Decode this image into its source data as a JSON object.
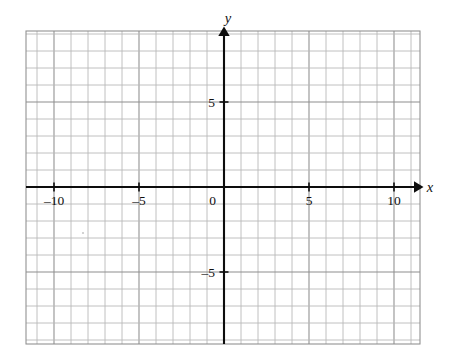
{
  "figure": {
    "kind": "cartesian-coordinate-plane",
    "title": "",
    "background_color": "#ffffff",
    "grid_color": "#b9b9b9",
    "axis_color": "#0d0d0d",
    "label_color": "#111111"
  },
  "chart_data": {
    "type": "scatter",
    "title": "",
    "xlabel": "x",
    "ylabel": "y",
    "xlim": [
      -11.6,
      11.5
    ],
    "ylim": [
      -9.2,
      9.2
    ],
    "grid": true,
    "grid_step": 1,
    "legend": "none",
    "series": [],
    "x": [],
    "y": [],
    "annotations": [],
    "xticks": [
      -10,
      -5,
      0,
      5,
      10
    ],
    "xticklabels": [
      "–10",
      "–5",
      "0",
      "5",
      "10"
    ],
    "yticks": [
      5,
      -5
    ],
    "yticklabels": [
      "5",
      "–5"
    ],
    "origin_label": "0"
  },
  "axes": {
    "x_axis_label": "x",
    "y_axis_label": "y",
    "origin_label": "0",
    "x_tick_labels": [
      {
        "value": -10,
        "text": "–10"
      },
      {
        "value": -5,
        "text": "–5"
      },
      {
        "value": 5,
        "text": "5"
      },
      {
        "value": 10,
        "text": "10"
      }
    ],
    "y_tick_labels": [
      {
        "value": 5,
        "text": "5"
      },
      {
        "value": -5,
        "text": "–5"
      }
    ]
  },
  "geometry": {
    "grid_left": 26,
    "grid_top": 31,
    "grid_right": 420,
    "grid_bottom": 344,
    "origin_x": 224,
    "origin_y": 187,
    "unit_px": 17
  }
}
